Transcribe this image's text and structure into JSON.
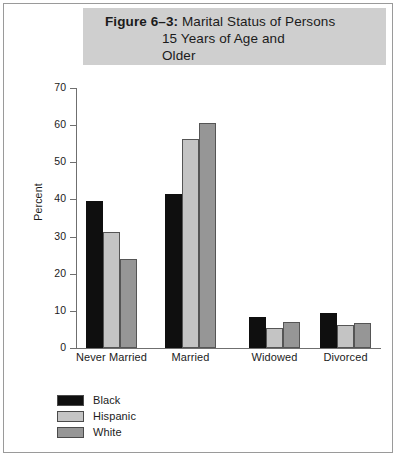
{
  "figure": {
    "border_color": "#9a9a9a",
    "title_band_color": "#cfcfcf"
  },
  "title": {
    "figure_label": "Figure 6–3:",
    "line1": " Marital Status of Persons",
    "line2": "15 Years of Age and",
    "line3": "Older"
  },
  "chart_data": {
    "type": "bar",
    "title": "Figure 6–3: Marital Status of Persons 15 Years of Age and Older",
    "xlabel": "",
    "ylabel": "Percent",
    "ylim": [
      0,
      70
    ],
    "yticks": [
      0,
      10,
      20,
      30,
      40,
      50,
      60,
      70
    ],
    "grid": false,
    "legend_position": "bottom-left",
    "categories": [
      "Never Married",
      "Married",
      "Widowed",
      "Divorced"
    ],
    "category_label_lines": [
      [
        "Never",
        "Married"
      ],
      [
        "Married"
      ],
      [
        "Widowed"
      ],
      [
        "Divorced"
      ]
    ],
    "series": [
      {
        "name": "Black",
        "color": "#0f0f0f",
        "values": [
          39.6,
          41.5,
          8.4,
          9.3
        ]
      },
      {
        "name": "Hispanic",
        "color": "#c4c4c4",
        "values": [
          31.3,
          56.3,
          5.3,
          6.2
        ]
      },
      {
        "name": "White",
        "color": "#969696",
        "values": [
          24.0,
          60.6,
          7.0,
          6.7
        ]
      }
    ]
  }
}
